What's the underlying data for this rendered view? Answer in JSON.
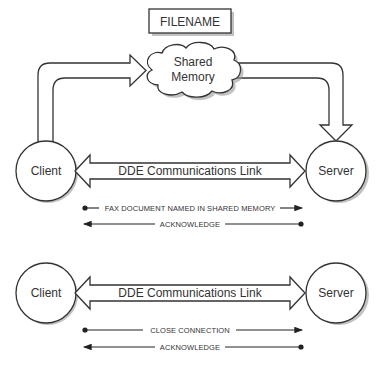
{
  "diagram": {
    "filename_label": "FILENAME",
    "shared_memory": {
      "line1": "Shared",
      "line2": "Memory"
    },
    "top_section": {
      "client_label": "Client",
      "server_label": "Server",
      "link_label": "DDE Communications Link",
      "messages": [
        {
          "text": "FAX DOCUMENT NAMED IN SHARED MEMORY",
          "direction": "client-to-server"
        },
        {
          "text": "ACKNOWLEDGE",
          "direction": "server-to-client"
        }
      ]
    },
    "bottom_section": {
      "client_label": "Client",
      "server_label": "Server",
      "link_label": "DDE Communications Link",
      "messages": [
        {
          "text": "CLOSE CONNECTION",
          "direction": "client-to-server"
        },
        {
          "text": "ACKNOWLEDGE",
          "direction": "server-to-client"
        }
      ]
    },
    "colors": {
      "stroke": "#333333",
      "shadow": "#9a9a9a",
      "background": "#ffffff"
    }
  }
}
